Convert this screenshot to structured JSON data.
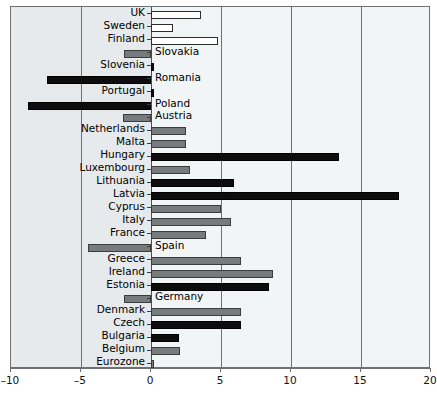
{
  "chart_data": {
    "type": "bar",
    "orientation": "horizontal",
    "title": "",
    "subtitle": "",
    "xlabel": "",
    "ylabel": "",
    "xlim": [
      -10,
      20
    ],
    "xticks": [
      -10,
      -5,
      0,
      5,
      10,
      15,
      20
    ],
    "xticklabels": [
      "–10",
      "–5",
      "0",
      "5",
      "10",
      "15",
      "20"
    ],
    "grid": true,
    "grid_axis": "x",
    "legend": null,
    "zero_line": 0,
    "categories": [
      "UK",
      "Sweden",
      "Finland",
      "Slovakia",
      "Slovenia",
      "Romania",
      "Portugal",
      "Poland",
      "Austria",
      "Netherlands",
      "Malta",
      "Hungary",
      "Luxembourg",
      "Lithuania",
      "Latvia",
      "Cyprus",
      "Italy",
      "France",
      "Spain",
      "Greece",
      "Ireland",
      "Estonia",
      "Germany",
      "Denmark",
      "Czech",
      "Bulgaria",
      "Belgium",
      "Eurozone"
    ],
    "values": [
      3.6,
      1.6,
      4.8,
      -1.9,
      0.2,
      -7.4,
      0.2,
      -8.8,
      -2.0,
      2.5,
      2.5,
      13.4,
      2.8,
      5.9,
      17.7,
      5.0,
      5.7,
      3.9,
      -4.5,
      6.4,
      8.7,
      8.4,
      -1.9,
      6.4,
      6.4,
      2.0,
      2.1,
      0.2
    ],
    "bar_colors": [
      "white",
      "white",
      "white",
      "gray",
      "black",
      "black",
      "black",
      "black",
      "gray",
      "gray",
      "gray",
      "black",
      "gray",
      "black",
      "black",
      "gray",
      "gray",
      "gray",
      "gray",
      "gray",
      "gray",
      "black",
      "gray",
      "gray",
      "black",
      "black",
      "gray",
      "gray"
    ],
    "label_side": [
      "left",
      "left",
      "left",
      "right",
      "left",
      "right",
      "left",
      "right",
      "right",
      "left",
      "left",
      "left",
      "left",
      "left",
      "left",
      "left",
      "left",
      "left",
      "right",
      "left",
      "left",
      "left",
      "right",
      "left",
      "left",
      "left",
      "left",
      "left"
    ],
    "color_key": {
      "black": "#0d0d0d",
      "gray": "#777b7e",
      "white": "#ffffff"
    }
  },
  "plot": {
    "background": "#eef1f3",
    "frame_color": "#6e7174"
  }
}
